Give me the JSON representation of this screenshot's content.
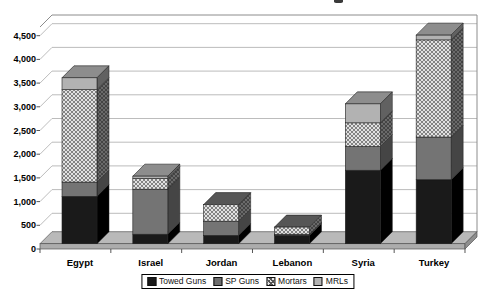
{
  "chart_data": {
    "type": "bar",
    "subtype": "stacked-3d-column",
    "categories": [
      "Egypt",
      "Israel",
      "Jordan",
      "Lebanon",
      "Syria",
      "Turkey"
    ],
    "series": [
      {
        "name": "Towed Guns",
        "values": [
          1000,
          200,
          175,
          175,
          1550,
          1350
        ],
        "front": "#1a1a1a",
        "side": "#000000",
        "top": "#3c3c3c",
        "hatch": false
      },
      {
        "name": "SP Guns",
        "values": [
          300,
          950,
          300,
          25,
          500,
          900
        ],
        "front": "#747474",
        "side": "#454545",
        "top": "#8a8a8a",
        "hatch": false
      },
      {
        "name": "Mortars",
        "values": [
          1950,
          225,
          350,
          150,
          500,
          2050
        ],
        "front": "#e2e2e2",
        "side": "#6a6a6a",
        "top": "#565656",
        "hatch": true
      },
      {
        "name": "MRLs",
        "values": [
          250,
          50,
          0,
          0,
          400,
          100
        ],
        "front": "#b2b2b2",
        "side": "#616161",
        "top": "#8d8d8d",
        "hatch": false
      }
    ],
    "ylim": [
      0,
      4500
    ],
    "y_tick_step": 500,
    "y_tick_labels": [
      "0",
      "500",
      "1,000",
      "1,500",
      "2,000",
      "2,500",
      "3,000",
      "3,500",
      "4,000",
      "4,500"
    ],
    "grid": true,
    "legend_position": "bottom",
    "legend_labels": [
      "Towed Guns",
      "SP Guns",
      "Mortars",
      "MRLs"
    ],
    "colors": {
      "grid_line": "#b4b4b4",
      "wall_edge": "#8c8c8c",
      "floor_top": "#b9b9b9",
      "floor_front": "#acacac",
      "floor_side": "#8f8f8f",
      "axis_tick": "#444444",
      "segment_outline": "#1f1f1f"
    }
  }
}
